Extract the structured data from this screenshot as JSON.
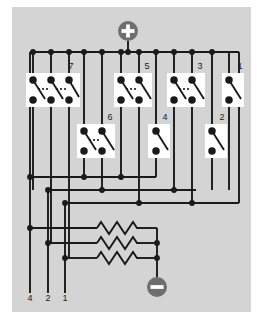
{
  "figure": {
    "background_color": "#d4d4d4",
    "page_color": "#ffffff",
    "wire_color": "#1a1a1a",
    "node_color": "#1a1a1a",
    "switch_panel_color": "#ffffff",
    "terminal_color": "#6e6e6e"
  },
  "terminals": {
    "positive": {
      "symbol": "+",
      "label": "+",
      "cx": 128,
      "cy": 31,
      "r": 10
    },
    "negative": {
      "symbol": "−",
      "label": "−",
      "cx": 157,
      "cy": 287,
      "r": 10
    }
  },
  "rails": {
    "top_rail_y": 52,
    "bus_lines": [
      {
        "name": "bus-1",
        "y": 177
      },
      {
        "name": "bus-2",
        "y": 190
      },
      {
        "name": "bus-3",
        "y": 203
      }
    ],
    "resistor_rows_y": [
      228,
      243,
      258
    ]
  },
  "switch_groups_top": [
    {
      "id": "group-7",
      "label": "7",
      "label_x": 71,
      "label_y": 67,
      "panel_x": 26,
      "panel_y": 73,
      "panel_w": 54,
      "panel_h": 34,
      "switch_count": 3,
      "ellipsis": true,
      "switch_x": [
        33,
        51,
        69
      ]
    },
    {
      "id": "group-5",
      "label": "5",
      "label_x": 147,
      "label_y": 67,
      "panel_x": 114,
      "panel_y": 73,
      "panel_w": 38,
      "panel_h": 34,
      "switch_count": 2,
      "ellipsis": true,
      "switch_x": [
        121,
        139
      ]
    },
    {
      "id": "group-3",
      "label": "3",
      "label_x": 200,
      "label_y": 67,
      "panel_x": 167,
      "panel_y": 73,
      "panel_w": 38,
      "panel_h": 34,
      "switch_count": 2,
      "ellipsis": true,
      "switch_x": [
        174,
        192
      ]
    },
    {
      "id": "group-1",
      "label": "1",
      "label_x": 240,
      "label_y": 67,
      "panel_x": 222,
      "panel_y": 73,
      "panel_w": 22,
      "panel_h": 34,
      "switch_count": 1,
      "ellipsis": false,
      "switch_x": [
        229
      ]
    }
  ],
  "switch_groups_bottom": [
    {
      "id": "group-6",
      "label": "6",
      "label_x": 110,
      "label_y": 118,
      "panel_x": 77,
      "panel_y": 124,
      "panel_w": 38,
      "panel_h": 34,
      "switch_count": 2,
      "ellipsis": true,
      "switch_x": [
        84,
        102
      ]
    },
    {
      "id": "group-4",
      "label": "4",
      "label_x": 165,
      "label_y": 118,
      "panel_x": 148,
      "panel_y": 124,
      "panel_w": 22,
      "panel_h": 34,
      "switch_count": 1,
      "ellipsis": false,
      "switch_x": [
        156
      ]
    },
    {
      "id": "group-2",
      "label": "2",
      "label_x": 222,
      "label_y": 118,
      "panel_x": 205,
      "panel_y": 124,
      "panel_w": 22,
      "panel_h": 34,
      "switch_count": 1,
      "ellipsis": false,
      "switch_x": [
        212
      ]
    }
  ],
  "output_terminals": [
    {
      "label": "4",
      "x": 30,
      "y": 297
    },
    {
      "label": "2",
      "x": 48,
      "y": 297
    },
    {
      "label": "1",
      "x": 65,
      "y": 297
    }
  ],
  "resistors": [
    {
      "name": "resistor-top",
      "x1": 97,
      "x2": 140,
      "y": 228,
      "zigzags": 5
    },
    {
      "name": "resistor-mid",
      "x1": 97,
      "x2": 140,
      "y": 243,
      "zigzags": 5
    },
    {
      "name": "resistor-bot",
      "x1": 97,
      "x2": 140,
      "y": 258,
      "zigzags": 5
    }
  ]
}
